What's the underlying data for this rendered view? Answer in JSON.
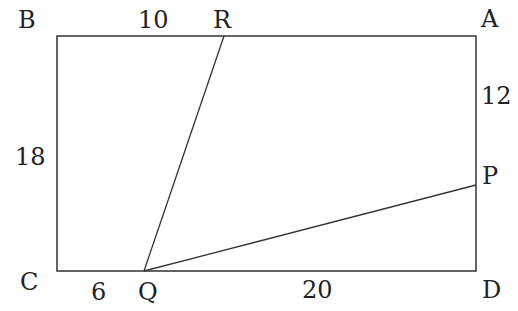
{
  "diagram": {
    "type": "geometry-rectangle",
    "vertices": {
      "B": {
        "label": "B",
        "x": 57,
        "y": 36
      },
      "A": {
        "label": "A",
        "x": 476,
        "y": 36
      },
      "C": {
        "label": "C",
        "x": 57,
        "y": 271
      },
      "D": {
        "label": "D",
        "x": 476,
        "y": 271
      },
      "R": {
        "label": "R",
        "x": 224,
        "y": 36
      },
      "Q": {
        "label": "Q",
        "x": 144,
        "y": 271
      },
      "P": {
        "label": "P",
        "x": 476,
        "y": 185
      }
    },
    "measures": {
      "BR": "10",
      "AP": "12",
      "BC": "18",
      "CQ": "6",
      "QD": "20"
    },
    "segments": [
      {
        "from": "Q",
        "to": "R"
      },
      {
        "from": "Q",
        "to": "P"
      }
    ],
    "line_color": "#333333"
  }
}
